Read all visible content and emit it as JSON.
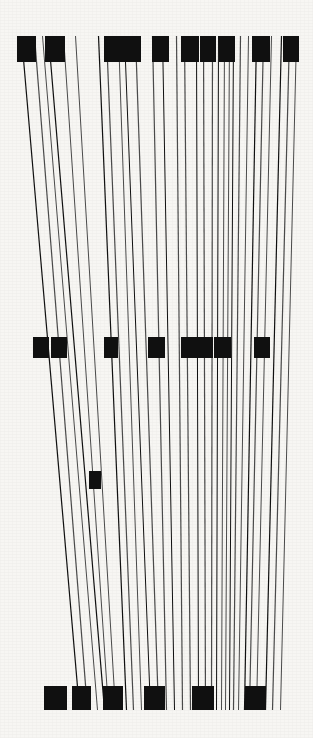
{
  "artwork": {
    "title": "Vertical Line Composition",
    "type": "generative-line-art",
    "canvas": {
      "width": 313,
      "height": 738
    },
    "palette": {
      "background": "#f7f6f3",
      "ink": "#101010",
      "ink_soft": "#4a4a4a"
    },
    "bands": {
      "top_marker_band": {
        "y": 36,
        "height": 28
      },
      "mid_marker_band": {
        "y": 337,
        "height": 22
      },
      "lone_marker_band": {
        "y": 471,
        "height": 18
      },
      "bottom_marker_band": {
        "y": 686,
        "height": 24
      },
      "line_top": 36,
      "line_bottom": 710
    },
    "lines": [
      {
        "x_top": 21,
        "x_bottom": 79,
        "weight": 1.2
      },
      {
        "x_top": 34,
        "x_bottom": 87,
        "weight": 1.2
      },
      {
        "x_top": 42,
        "x_bottom": 97,
        "weight": 1.0
      },
      {
        "x_top": 48,
        "x_bottom": 104,
        "weight": 1.2
      },
      {
        "x_top": 63,
        "x_bottom": 108,
        "weight": 1.0
      },
      {
        "x_top": 75,
        "x_bottom": 115,
        "weight": 1.0
      },
      {
        "x_top": 98,
        "x_bottom": 126,
        "weight": 1.2
      },
      {
        "x_top": 106,
        "x_bottom": 133,
        "weight": 1.2
      },
      {
        "x_top": 118,
        "x_bottom": 141,
        "weight": 1.0
      },
      {
        "x_top": 124,
        "x_bottom": 150,
        "weight": 1.0
      },
      {
        "x_top": 135,
        "x_bottom": 158,
        "weight": 1.2
      },
      {
        "x_top": 152,
        "x_bottom": 166,
        "weight": 1.2
      },
      {
        "x_top": 162,
        "x_bottom": 174,
        "weight": 1.0
      },
      {
        "x_top": 176,
        "x_bottom": 182,
        "weight": 1.2
      },
      {
        "x_top": 184,
        "x_bottom": 190,
        "weight": 1.2
      },
      {
        "x_top": 196,
        "x_bottom": 198,
        "weight": 1.0
      },
      {
        "x_top": 203,
        "x_bottom": 205,
        "weight": 1.2
      },
      {
        "x_top": 212,
        "x_bottom": 211,
        "weight": 1.2
      },
      {
        "x_top": 218,
        "x_bottom": 216,
        "weight": 1.0
      },
      {
        "x_top": 224,
        "x_bottom": 221,
        "weight": 1.0
      },
      {
        "x_top": 229,
        "x_bottom": 225,
        "weight": 1.0
      },
      {
        "x_top": 233,
        "x_bottom": 229,
        "weight": 1.0
      },
      {
        "x_top": 240,
        "x_bottom": 233,
        "weight": 1.2
      },
      {
        "x_top": 248,
        "x_bottom": 238,
        "weight": 1.0
      },
      {
        "x_top": 256,
        "x_bottom": 244,
        "weight": 1.2
      },
      {
        "x_top": 263,
        "x_bottom": 249,
        "weight": 1.2
      },
      {
        "x_top": 271,
        "x_bottom": 256,
        "weight": 1.0
      },
      {
        "x_top": 281,
        "x_bottom": 265,
        "weight": 1.2
      },
      {
        "x_top": 289,
        "x_bottom": 272,
        "weight": 1.2
      },
      {
        "x_top": 296,
        "x_bottom": 280,
        "weight": 1.0
      }
    ],
    "top_markers": [
      {
        "x": 17,
        "width": 19,
        "height": 26
      },
      {
        "x": 45,
        "width": 20,
        "height": 26
      },
      {
        "x": 104,
        "width": 19,
        "height": 26
      },
      {
        "x": 123,
        "width": 18,
        "height": 26
      },
      {
        "x": 152,
        "width": 17,
        "height": 26
      },
      {
        "x": 181,
        "width": 18,
        "height": 26
      },
      {
        "x": 200,
        "width": 16,
        "height": 26
      },
      {
        "x": 219,
        "width": 16,
        "height": 26
      },
      {
        "x": 252,
        "width": 18,
        "height": 26
      },
      {
        "x": 283,
        "width": 16,
        "height": 26
      }
    ],
    "mid_markers": [
      {
        "x": 33,
        "width": 16,
        "height": 21
      },
      {
        "x": 51,
        "width": 16,
        "height": 21
      },
      {
        "x": 104,
        "width": 14,
        "height": 21
      },
      {
        "x": 148,
        "width": 17,
        "height": 21
      },
      {
        "x": 181,
        "width": 18,
        "height": 21
      },
      {
        "x": 199,
        "width": 14,
        "height": 21
      },
      {
        "x": 214,
        "width": 17,
        "height": 21
      },
      {
        "x": 254,
        "width": 16,
        "height": 21
      }
    ],
    "lone_markers": [
      {
        "x": 89,
        "width": 12,
        "height": 18
      }
    ],
    "bottom_markers": [
      {
        "x": 44,
        "width": 23,
        "height": 24
      },
      {
        "x": 72,
        "width": 19,
        "height": 24
      },
      {
        "x": 103,
        "width": 20,
        "height": 24
      },
      {
        "x": 144,
        "width": 21,
        "height": 24
      },
      {
        "x": 192,
        "width": 22,
        "height": 24
      },
      {
        "x": 245,
        "width": 21,
        "height": 24
      }
    ],
    "counts": {
      "lines": 30,
      "top_markers": 10,
      "mid_markers": 8,
      "lone_markers": 1,
      "bottom_markers": 6
    }
  }
}
